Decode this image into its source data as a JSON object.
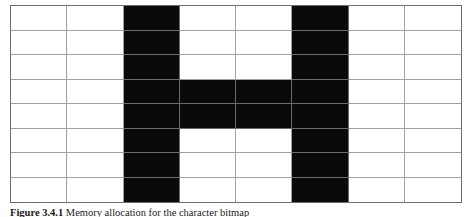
{
  "figure": {
    "caption_label": "Figure 3.4.1",
    "caption_text": "Memory allocation for the character bitmap"
  },
  "chart_data": {
    "type": "heatmap",
    "title": "",
    "columns": 8,
    "rows": 8,
    "on_color": "#0a0a0a",
    "off_color": "#ffffff",
    "gridline_color": "#a0a0a0",
    "border_color": "#6e6e6e",
    "legend": [
      {
        "label": "on",
        "value": 1,
        "color": "#0a0a0a"
      },
      {
        "label": "off",
        "value": 0,
        "color": "#ffffff"
      }
    ],
    "matrix": [
      [
        0,
        0,
        1,
        0,
        0,
        1,
        0,
        0
      ],
      [
        0,
        0,
        1,
        0,
        0,
        1,
        0,
        0
      ],
      [
        0,
        0,
        1,
        0,
        0,
        1,
        0,
        0
      ],
      [
        0,
        0,
        1,
        1,
        1,
        1,
        0,
        0
      ],
      [
        0,
        0,
        1,
        1,
        1,
        1,
        0,
        0
      ],
      [
        0,
        0,
        1,
        0,
        0,
        1,
        0,
        0
      ],
      [
        0,
        0,
        1,
        0,
        0,
        1,
        0,
        0
      ],
      [
        0,
        0,
        1,
        0,
        0,
        1,
        0,
        0
      ]
    ],
    "row_bytes": [
      "0x24",
      "0x24",
      "0x24",
      "0x3C",
      "0x3C",
      "0x24",
      "0x24",
      "0x24"
    ]
  }
}
